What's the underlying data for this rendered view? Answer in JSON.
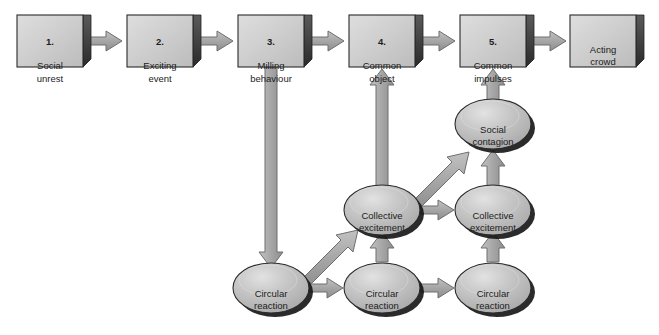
{
  "diagram": {
    "colors": {
      "box_face": "#c9c9c9",
      "box_face_light": "#d8d8d8",
      "ellipse_face": "#bdbdbd",
      "ellipse_highlight": "#d4d4d4",
      "shadow": "#111111",
      "arrow_fill": "#a8a8a8",
      "arrow_stroke": "#6e6e6e",
      "outline": "#2b2b2b",
      "text": "#1c1c1c",
      "background": "#ffffff"
    },
    "stages": [
      {
        "id": "stage-1",
        "number": "1.",
        "label": "Social\nunrest",
        "x": 17,
        "y": 15
      },
      {
        "id": "stage-2",
        "number": "2.",
        "label": "Exciting\nevent",
        "x": 127,
        "y": 15
      },
      {
        "id": "stage-3",
        "number": "3.",
        "label": "Milling\nbehaviour",
        "x": 238,
        "y": 15
      },
      {
        "id": "stage-4",
        "number": "4.",
        "label": "Common\nobject",
        "x": 349,
        "y": 15
      },
      {
        "id": "stage-5",
        "number": "5.",
        "label": "Common\nimpulses",
        "x": 460,
        "y": 15
      },
      {
        "id": "outcome",
        "number": "",
        "label": "Acting\ncrowd",
        "x": 570,
        "y": 15
      }
    ],
    "processes": [
      {
        "id": "social-contagion-1",
        "label": "Social\ncontagion",
        "cx": 493,
        "cy": 124
      },
      {
        "id": "collective-excitement-1",
        "label": "Collective\nexcitement",
        "cx": 382,
        "cy": 210
      },
      {
        "id": "collective-excitement-2",
        "label": "Collective\nexcitement",
        "cx": 493,
        "cy": 210
      },
      {
        "id": "circular-reaction-1",
        "label": "Circular\nreaction",
        "cx": 271,
        "cy": 288
      },
      {
        "id": "circular-reaction-2",
        "label": "Circular\nreaction",
        "cx": 382,
        "cy": 288
      },
      {
        "id": "circular-reaction-3",
        "label": "Circular\nreaction",
        "cx": 493,
        "cy": 288
      }
    ],
    "connections": [
      {
        "from": "stage-1",
        "to": "stage-2",
        "kind": "horizontal"
      },
      {
        "from": "stage-2",
        "to": "stage-3",
        "kind": "horizontal"
      },
      {
        "from": "stage-3",
        "to": "stage-4",
        "kind": "horizontal"
      },
      {
        "from": "stage-4",
        "to": "stage-5",
        "kind": "horizontal"
      },
      {
        "from": "stage-5",
        "to": "outcome",
        "kind": "horizontal"
      },
      {
        "from": "stage-3",
        "to": "circular-reaction-1",
        "kind": "vertical-down"
      },
      {
        "from": "circular-reaction-1",
        "to": "circular-reaction-2",
        "kind": "horizontal"
      },
      {
        "from": "circular-reaction-2",
        "to": "circular-reaction-3",
        "kind": "horizontal"
      },
      {
        "from": "circular-reaction-1",
        "to": "collective-excitement-1",
        "kind": "diagonal-up"
      },
      {
        "from": "circular-reaction-2",
        "to": "collective-excitement-1",
        "kind": "vertical-up"
      },
      {
        "from": "circular-reaction-3",
        "to": "collective-excitement-2",
        "kind": "vertical-up"
      },
      {
        "from": "collective-excitement-1",
        "to": "collective-excitement-2",
        "kind": "horizontal"
      },
      {
        "from": "collective-excitement-1",
        "to": "social-contagion-1",
        "kind": "diagonal-up"
      },
      {
        "from": "collective-excitement-2",
        "to": "social-contagion-1",
        "kind": "vertical-up"
      },
      {
        "from": "collective-excitement-1",
        "to": "stage-4",
        "kind": "vertical-up"
      },
      {
        "from": "social-contagion-1",
        "to": "stage-5",
        "kind": "vertical-up"
      }
    ]
  }
}
